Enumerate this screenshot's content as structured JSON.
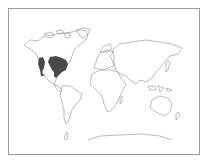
{
  "map": {
    "type": "world range map",
    "highlighted_region": "Eastern and western North America (USA, southern Canada, northern Mexico)",
    "colors": {
      "land_outline": "#8c8c8c",
      "range_fill": "#4a4a4a",
      "background": "#ffffff",
      "frame": "#9a9a9a"
    }
  }
}
